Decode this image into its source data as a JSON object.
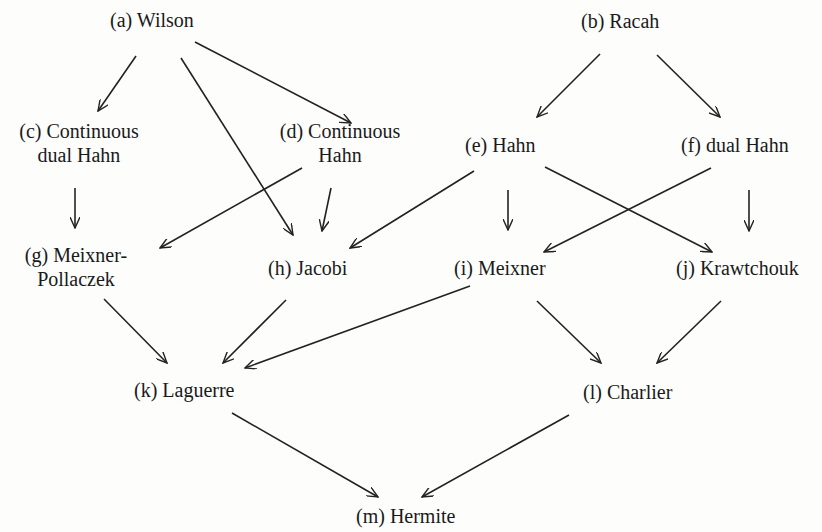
{
  "nodes": {
    "a": {
      "label": "(a) Wilson"
    },
    "b": {
      "label": "(b) Racah"
    },
    "c": {
      "line1": "(c) Continuous",
      "line2": "dual Hahn"
    },
    "d": {
      "line1": "(d) Continuous",
      "line2": "Hahn"
    },
    "e": {
      "label": "(e) Hahn"
    },
    "f": {
      "label": "(f) dual Hahn"
    },
    "g": {
      "line1": "(g) Meixner-",
      "line2": "Pollaczek"
    },
    "h": {
      "label": "(h) Jacobi"
    },
    "i": {
      "label": "(i) Meixner"
    },
    "j": {
      "label": "(j) Krawtchouk"
    },
    "k": {
      "label": "(k) Laguerre"
    },
    "l": {
      "label": "(l) Charlier"
    },
    "m": {
      "label": "(m) Hermite"
    }
  },
  "edges": [
    {
      "from": "a",
      "to": "c"
    },
    {
      "from": "a",
      "to": "d"
    },
    {
      "from": "a",
      "to": "h"
    },
    {
      "from": "b",
      "to": "e"
    },
    {
      "from": "b",
      "to": "f"
    },
    {
      "from": "c",
      "to": "g"
    },
    {
      "from": "d",
      "to": "g"
    },
    {
      "from": "d",
      "to": "h"
    },
    {
      "from": "e",
      "to": "h"
    },
    {
      "from": "e",
      "to": "i"
    },
    {
      "from": "e",
      "to": "j"
    },
    {
      "from": "f",
      "to": "i"
    },
    {
      "from": "f",
      "to": "j"
    },
    {
      "from": "g",
      "to": "k"
    },
    {
      "from": "h",
      "to": "k"
    },
    {
      "from": "i",
      "to": "k"
    },
    {
      "from": "i",
      "to": "l"
    },
    {
      "from": "j",
      "to": "l"
    },
    {
      "from": "k",
      "to": "m"
    },
    {
      "from": "l",
      "to": "m"
    }
  ],
  "style": {
    "ink": "#1a1a1a",
    "background": "#fdfdfc"
  }
}
